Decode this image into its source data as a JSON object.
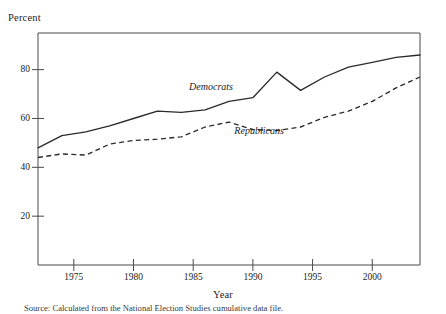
{
  "figure": {
    "y_axis_title": "Percent",
    "x_axis_title": "Year",
    "source_note": "Source: Calculated from the National Election Studies cumulative data file.",
    "series_label_democrats": "Democrats",
    "series_label_republicans": "Republicans",
    "tick_labels": {
      "y": [
        "20",
        "40",
        "60",
        "80"
      ],
      "x": [
        "1975",
        "1980",
        "1985",
        "1990",
        "1995",
        "2000"
      ]
    },
    "colors": {
      "axis": "#4a4a4a",
      "democrats_line": "#2b2b2b",
      "republicans_line": "#2b2b2b",
      "background": "#ffffff",
      "text": "#1d1d1d"
    }
  },
  "chart_data": {
    "type": "line",
    "title": "",
    "subtitle": "",
    "xlabel": "Year",
    "ylabel": "Percent",
    "xlim": [
      1972,
      2004
    ],
    "ylim": [
      0,
      95
    ],
    "xticks": [
      1975,
      1980,
      1985,
      1990,
      1995,
      2000
    ],
    "yticks": [
      20,
      40,
      60,
      80
    ],
    "grid": false,
    "legend_position": "inline-annotation",
    "annotations": [
      {
        "text": "Democrats",
        "x": 1986.5,
        "y": 73
      },
      {
        "text": "Republicans",
        "x": 1990.5,
        "y": 55
      }
    ],
    "x": [
      1972,
      1974,
      1976,
      1978,
      1980,
      1982,
      1984,
      1986,
      1988,
      1990,
      1992,
      1994,
      1996,
      1998,
      2000,
      2002,
      2004
    ],
    "series": [
      {
        "name": "Democrats",
        "style": "solid",
        "values": [
          48,
          53,
          54.5,
          57,
          60,
          63,
          62.5,
          63.5,
          67,
          68.5,
          79,
          71.5,
          77,
          81,
          83,
          85,
          86
        ]
      },
      {
        "name": "Republicans",
        "style": "dashed",
        "values": [
          44,
          45.5,
          45,
          49.5,
          51,
          51.5,
          52.5,
          56.5,
          58.5,
          55.5,
          55,
          56.5,
          60.5,
          63,
          67,
          72.5,
          77
        ]
      }
    ]
  }
}
